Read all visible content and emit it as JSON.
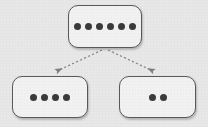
{
  "diagram": {
    "type": "tree",
    "background_color": "#e8e8e8",
    "node_fill_color": "#f2f2f2",
    "node_border_color": "#5a5a5a",
    "dot_color": "#3b3b3b",
    "connector_color": "#8c8c8c",
    "connector_style": "dashed",
    "arrowhead": "filled-triangle",
    "nodes": [
      {
        "id": "root",
        "role": "parent-node",
        "dot_count": 6,
        "dots": [
          1,
          2,
          3,
          4,
          5,
          6
        ]
      },
      {
        "id": "child-left",
        "role": "child-node",
        "dot_count": 4,
        "dots": [
          1,
          2,
          3,
          4
        ]
      },
      {
        "id": "child-right",
        "role": "child-node",
        "dot_count": 2,
        "dots": [
          1,
          2
        ]
      }
    ],
    "edges": [
      {
        "id": "edge-root-to-left",
        "from": "root",
        "to": "child-left",
        "directed": true
      },
      {
        "id": "edge-root-to-right",
        "from": "root",
        "to": "child-right",
        "directed": true
      }
    ]
  }
}
